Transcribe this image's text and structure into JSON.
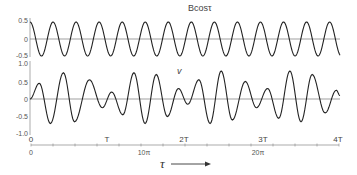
{
  "chart_data": [
    {
      "type": "line",
      "panel": "top",
      "title": "Bcosτ",
      "ylabel": "",
      "yticks": [
        "0.5",
        "0",
        "-0.5"
      ],
      "ylim": [
        -0.5,
        0.5
      ],
      "x_range_tau": [
        0,
        27.2
      ],
      "description": "Pure cosine of amplitude 0.5, period 2π in τ",
      "amplitude": 0.5,
      "period_tau": 6.2832,
      "start_phase": "maximum at τ=0",
      "zero_line": true
    },
    {
      "type": "line",
      "panel": "middle",
      "title": "v",
      "ylabel": "",
      "yticks": [
        "1.0",
        "0.5",
        "0",
        "-0.5",
        "-1.0"
      ],
      "ylim": [
        -1.0,
        1.0
      ],
      "zero_line": true,
      "description": "Amplitude-modulated oscillation (beats), carrier period ≈ 2π",
      "extrema": [
        {
          "tau": 0.0,
          "v": 0.0
        },
        {
          "tau": 0.5,
          "v": 0.45
        },
        {
          "tau": 1.1,
          "v": -0.7
        },
        {
          "tau": 1.8,
          "v": 0.75
        },
        {
          "tau": 2.4,
          "v": -0.65
        },
        {
          "tau": 3.2,
          "v": 0.55
        },
        {
          "tau": 3.9,
          "v": -0.25
        },
        {
          "tau": 4.4,
          "v": 0.2
        },
        {
          "tau": 5.0,
          "v": -0.45
        },
        {
          "tau": 5.6,
          "v": 0.75
        },
        {
          "tau": 6.2,
          "v": -0.7
        },
        {
          "tau": 6.8,
          "v": 0.7
        },
        {
          "tau": 7.4,
          "v": -0.5
        },
        {
          "tau": 8.0,
          "v": 0.3
        },
        {
          "tau": 8.5,
          "v": -0.15
        },
        {
          "tau": 9.1,
          "v": 0.55
        },
        {
          "tau": 9.7,
          "v": -0.7
        },
        {
          "tau": 10.3,
          "v": 0.8
        },
        {
          "tau": 10.9,
          "v": -0.6
        },
        {
          "tau": 11.6,
          "v": 0.5
        },
        {
          "tau": 12.2,
          "v": -0.25
        },
        {
          "tau": 12.8,
          "v": 0.3
        },
        {
          "tau": 13.4,
          "v": -0.55
        },
        {
          "tau": 14.0,
          "v": 0.8
        },
        {
          "tau": 14.6,
          "v": -0.65
        },
        {
          "tau": 15.2,
          "v": 0.7
        },
        {
          "tau": 15.9,
          "v": -0.4
        },
        {
          "tau": 16.5,
          "v": 0.25
        },
        {
          "tau": 16.7,
          "v": 0.1
        }
      ],
      "extrema_units": "tau in units of 2π-periods index-scaled (x position fraction × 16.7 cycles)"
    }
  ],
  "x_axis": {
    "label": "τ",
    "arrow": "→",
    "period_ticks": [
      {
        "label": "0",
        "frac": 0.0
      },
      {
        "label": "T",
        "frac": 0.247
      },
      {
        "label": "2T",
        "frac": 0.497
      },
      {
        "label": "3T",
        "frac": 0.753
      },
      {
        "label": "4T",
        "frac": 1.0
      }
    ],
    "pi_ticks": [
      {
        "label": "0",
        "frac": 0.0
      },
      {
        "label": "10π",
        "frac": 0.367
      },
      {
        "label": "20π",
        "frac": 0.737
      }
    ],
    "minor_tick_count": 14
  },
  "labels": {
    "top_title": "Bcosτ",
    "middle_title": "v",
    "x_axis_label": "τ",
    "top_ytick_pos": "0.5",
    "top_ytick_zero": "0",
    "top_ytick_neg": "-0.5",
    "mid_ytick_1": "1.0",
    "mid_ytick_05": "0.5",
    "mid_ytick_0": "0",
    "mid_ytick_m05": "-0.5",
    "mid_ytick_m1": "-1.0",
    "t0": "0",
    "t1": "T",
    "t2": "2T",
    "t3": "3T",
    "t4": "4T",
    "pi0": "0",
    "pi10": "10π",
    "pi20": "20π"
  },
  "colors": {
    "line": "#222222",
    "zero_line": "#777777",
    "axis": "#888888"
  }
}
